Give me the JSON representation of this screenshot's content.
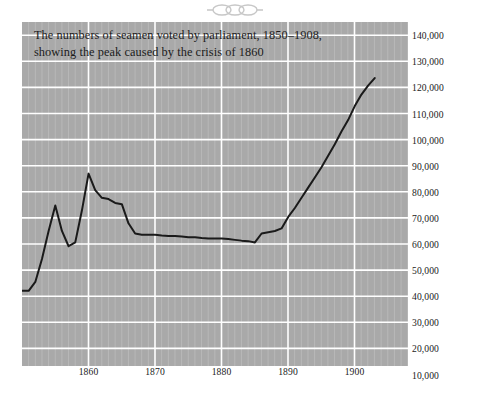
{
  "figure": {
    "ornament": "decorative-flourish",
    "background_color": "#ffffff",
    "plot_background_color": "#a9a9a9",
    "grid_color": "#ffffff",
    "line_color": "#1a1a1a"
  },
  "chart_data": {
    "type": "line",
    "title": "The numbers of seamen voted by parliament, 1850–1908, showing the peak caused by the crisis of 1860",
    "title_lines": [
      "The numbers of seamen voted by parliament, 1850–1908,",
      "showing the peak caused by the crisis of 1860"
    ],
    "xlabel": "",
    "ylabel": "",
    "xlim": [
      1850,
      1908
    ],
    "ylim": [
      10000,
      145000
    ],
    "grid": true,
    "minor_grid": true,
    "legend": false,
    "x_ticks": [
      1860,
      1870,
      1880,
      1890,
      1900
    ],
    "x_tick_labels": [
      "1860",
      "1870",
      "1880",
      "1890",
      "1900"
    ],
    "y_ticks": [
      10000,
      20000,
      30000,
      40000,
      50000,
      60000,
      70000,
      80000,
      90000,
      100000,
      110000,
      120000,
      130000,
      140000
    ],
    "y_tick_labels": [
      "10,000",
      "20,000",
      "30,000",
      "40,000",
      "50,000",
      "60,000",
      "70,000",
      "80,000",
      "90,000",
      "100,000",
      "110,000",
      "120,000",
      "130,000",
      "140,000"
    ],
    "series": [
      {
        "name": "Seamen voted by parliament",
        "x": [
          1850,
          1851,
          1852,
          1853,
          1854,
          1855,
          1856,
          1857,
          1858,
          1859,
          1860,
          1861,
          1862,
          1863,
          1864,
          1865,
          1866,
          1867,
          1868,
          1869,
          1870,
          1871,
          1872,
          1873,
          1874,
          1875,
          1876,
          1877,
          1878,
          1879,
          1880,
          1881,
          1882,
          1883,
          1884,
          1885,
          1886,
          1887,
          1888,
          1889,
          1890,
          1891,
          1892,
          1893,
          1894,
          1895,
          1896,
          1897,
          1898,
          1899,
          1900,
          1901,
          1902,
          1903
        ],
        "values": [
          39500,
          39500,
          43000,
          52000,
          63000,
          73000,
          63000,
          57000,
          58500,
          71000,
          85500,
          79000,
          76000,
          75500,
          74000,
          73500,
          66000,
          62000,
          61500,
          61500,
          61500,
          61200,
          61000,
          61000,
          60800,
          60500,
          60500,
          60200,
          60000,
          60000,
          60000,
          59800,
          59500,
          59200,
          59000,
          58500,
          62000,
          62500,
          63000,
          64000,
          68500,
          72000,
          76000,
          80000,
          84000,
          88000,
          92500,
          97000,
          102000,
          106500,
          112000,
          116500,
          120000,
          123000
        ],
        "color": "#1a1a1a",
        "line_width": 2
      }
    ],
    "start_value": 39500,
    "peak": {
      "year": 1860,
      "value": 85500,
      "note": "peak caused by the crisis of 1860"
    },
    "end_value": 123000
  }
}
